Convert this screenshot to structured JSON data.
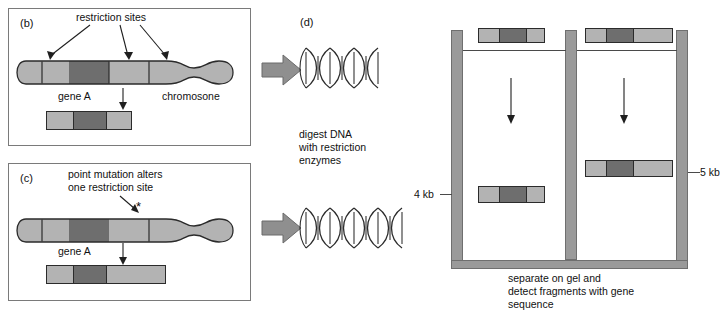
{
  "figure": {
    "title_visible": false,
    "colors": {
      "segment_light": "#b3b3b3",
      "segment_dark": "#6e6e6e",
      "outline": "#2b2b2b",
      "panel_border": "#7a7a7a",
      "block_arrow": "#8f8f8f",
      "gel_wall": "#9a9a9a"
    }
  },
  "panel_b": {
    "label": "(b)",
    "callout": "restriction sites",
    "gene_label": "gene A",
    "chromosome_label": "chromosone",
    "restriction_site_count": 3,
    "fragment_segments": [
      "light",
      "dark",
      "light"
    ],
    "fragment_size_kb": 4
  },
  "panel_c": {
    "label": "(c)",
    "callout_line1": "point mutation alters",
    "callout_line2": "one restriction site",
    "mutation_marker": "*",
    "gene_label": "gene A",
    "restriction_site_count": 2,
    "fragment_segments": [
      "light",
      "dark",
      "light-long"
    ],
    "fragment_size_kb": 5
  },
  "panel_d": {
    "label": "(d)",
    "step_text_line1": "digest DNA",
    "step_text_line2": "with restriction",
    "step_text_line3": "enzymes",
    "helix_top_units": 3,
    "helix_bottom_units": 4
  },
  "gel": {
    "left_lane": {
      "well_band_segments": [
        "light",
        "dark",
        "light"
      ],
      "well_band_width_px": 67,
      "result_band_segments": [
        "light",
        "dark",
        "light"
      ],
      "result_band_width_px": 67,
      "size_label": "4 kb",
      "migration": "far"
    },
    "right_lane": {
      "well_band_segments": [
        "light",
        "dark",
        "light-long"
      ],
      "well_band_width_px": 88,
      "result_band_segments": [
        "light",
        "dark",
        "light-long"
      ],
      "result_band_width_px": 88,
      "size_label": "5 kb",
      "migration": "near"
    },
    "caption_line1": "separate on gel and",
    "caption_line2": "detect fragments with gene",
    "caption_line3": "sequence"
  }
}
